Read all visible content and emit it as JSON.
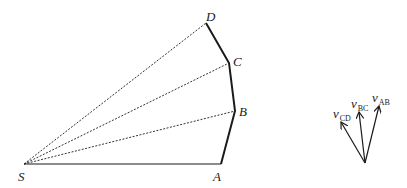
{
  "diagram": {
    "points": {
      "S": {
        "label": "S",
        "x": 24,
        "y": 164
      },
      "A": {
        "label": "A",
        "x": 221,
        "y": 164
      },
      "B": {
        "label": "B",
        "x": 235,
        "y": 111
      },
      "C": {
        "label": "C",
        "x": 229,
        "y": 63
      },
      "D": {
        "label": "D",
        "x": 206,
        "y": 23
      }
    },
    "solid_path": [
      "S",
      "A",
      "B",
      "C",
      "D"
    ],
    "dashed_rays": [
      "B",
      "C",
      "D"
    ],
    "vectors": {
      "origin": {
        "x": 365,
        "y": 163
      },
      "items": [
        {
          "name": "v",
          "subscript": "AB",
          "tip_x": 379,
          "tip_y": 106
        },
        {
          "name": "v",
          "subscript": "BC",
          "tip_x": 359,
          "tip_y": 112
        },
        {
          "name": "v",
          "subscript": "CD",
          "tip_x": 341,
          "tip_y": 122
        }
      ]
    },
    "colors": {
      "line": "#1a1a1a",
      "dashed": "#333333"
    }
  }
}
